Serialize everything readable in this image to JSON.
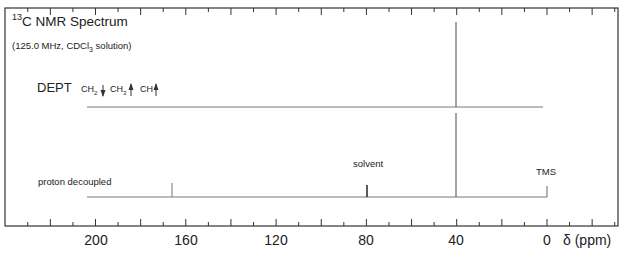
{
  "chart_data": {
    "type": "line",
    "title": "13C NMR Spectrum",
    "title_superscript": "13",
    "title_rest": "C NMR Spectrum",
    "subtitle": "(125.0 MHz, CDCl3 solution)",
    "xlabel": "δ (ppm)",
    "xlim": [
      220,
      -10
    ],
    "x_reversed": true,
    "xticks_major": [
      200,
      160,
      120,
      80,
      40,
      0
    ],
    "xtick_labels": [
      "200",
      "160",
      "120",
      "80",
      "40",
      "0"
    ],
    "minor_tick_step": 10,
    "grid": false,
    "series": [
      {
        "name": "DEPT",
        "legend": [
          {
            "group": "CH2",
            "direction": "down"
          },
          {
            "group": "CH3",
            "direction": "up"
          },
          {
            "group": "CH",
            "direction": "up"
          }
        ],
        "peaks": [
          {
            "ppm": 40,
            "height": 1.0,
            "direction": "up"
          }
        ]
      },
      {
        "name": "proton decoupled",
        "peaks": [
          {
            "ppm": 167,
            "height": 0.15,
            "label": ""
          },
          {
            "ppm": 40,
            "height": 1.0,
            "label": ""
          },
          {
            "ppm": 77,
            "height": 0.12,
            "label": "solvent"
          },
          {
            "ppm": 0,
            "height": 0.15,
            "label": "TMS"
          }
        ]
      }
    ]
  },
  "labels": {
    "title_sup": "13",
    "title_main": "C NMR Spectrum",
    "sub_pre": "(125.0 MHz, CDCl",
    "sub_idx": "3",
    "sub_post": " solution)",
    "dept": "DEPT",
    "ch2_a": "CH",
    "ch2_b": "2",
    "ch3_a": "CH",
    "ch3_b": "3",
    "ch": "CH",
    "proton_decoupled": "proton decoupled",
    "solvent": "solvent",
    "tms": "TMS",
    "unit": "δ (ppm)",
    "t200": "200",
    "t160": "160",
    "t120": "120",
    "t80": "80",
    "t40": "40",
    "t0": "0"
  }
}
